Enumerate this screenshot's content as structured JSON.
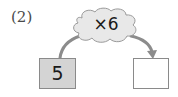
{
  "problem": {
    "label": "(2)"
  },
  "operation": {
    "label": "×6",
    "symbol": "×",
    "operand": 6
  },
  "input_box": {
    "value": "5",
    "fill_color": "#d4d4d4"
  },
  "output_box": {
    "value": "",
    "fill_color": "#ffffff"
  },
  "colors": {
    "cloud_fill": "#e8e8e8",
    "cloud_stroke": "#9a9a9a",
    "arrow": "#8c8c8c",
    "border": "#8a8a8a"
  }
}
